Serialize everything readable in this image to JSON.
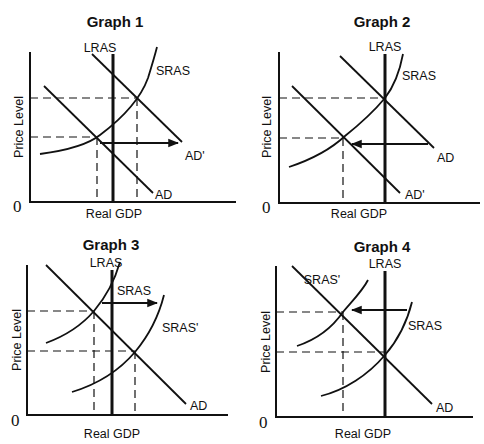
{
  "graphs": [
    {
      "title": "Graph 1",
      "xlabel": "Real GDP",
      "ylabel": "Price Level",
      "origin": "0",
      "labels": {
        "lras": "LRAS",
        "sras": "SRAS",
        "ad": "AD",
        "ad_shifted": "AD'"
      },
      "shift": "AD shifts right to AD'"
    },
    {
      "title": "Graph 2",
      "xlabel": "Real GDP",
      "ylabel": "Price Level",
      "origin": "0",
      "labels": {
        "lras": "LRAS",
        "sras": "SRAS",
        "ad": "AD",
        "ad_shifted": "AD'"
      },
      "shift": "AD shifts left to AD'"
    },
    {
      "title": "Graph 3",
      "xlabel": "Real GDP",
      "ylabel": "Price Level",
      "origin": "0",
      "labels": {
        "lras": "LRAS",
        "sras": "SRAS",
        "sras_shifted": "SRAS'",
        "ad": "AD"
      },
      "shift": "SRAS shifts right to SRAS'"
    },
    {
      "title": "Graph 4",
      "xlabel": "Real GDP",
      "ylabel": "Price Level",
      "origin": "0",
      "labels": {
        "lras": "LRAS",
        "sras": "SRAS",
        "sras_shifted": "SRAS'",
        "ad": "AD"
      },
      "shift": "SRAS shifts left to SRAS'"
    }
  ]
}
